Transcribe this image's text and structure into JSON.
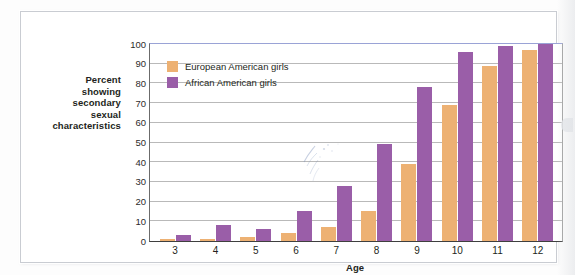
{
  "figure": {
    "y_axis_title_lines": [
      "Percent",
      "showing",
      "secondary",
      "sexual",
      "characteristics"
    ],
    "x_axis_title": "Age"
  },
  "legend": {
    "items": [
      {
        "label": "European American girls",
        "color": "#edb173",
        "key": "european"
      },
      {
        "label": "African American girls",
        "color": "#9a5ea8",
        "key": "african"
      }
    ]
  },
  "chart_data": {
    "type": "bar",
    "title": "",
    "subtitle": "",
    "xlabel": "Age",
    "ylabel": "Percent showing secondary sexual characteristics",
    "categories": [
      "3",
      "4",
      "5",
      "6",
      "7",
      "8",
      "9",
      "10",
      "11",
      "12"
    ],
    "series": [
      {
        "name": "European American girls",
        "color": "#edb173",
        "values": [
          1,
          1,
          2,
          4,
          7,
          15,
          39,
          69,
          89,
          97
        ]
      },
      {
        "name": "African American girls",
        "color": "#9a5ea8",
        "values": [
          3,
          8,
          6,
          15,
          28,
          49,
          78,
          96,
          99,
          100
        ]
      }
    ],
    "ylim": [
      0,
      100
    ],
    "yticks": [
      0,
      10,
      20,
      30,
      40,
      50,
      60,
      70,
      80,
      90,
      100
    ],
    "ytick_labels": [
      "0",
      "10",
      "20",
      "30",
      "40",
      "50",
      "60",
      "70",
      "80",
      "90",
      "100"
    ],
    "grid": "horizontal",
    "legend_position": "upper-left-inside"
  }
}
